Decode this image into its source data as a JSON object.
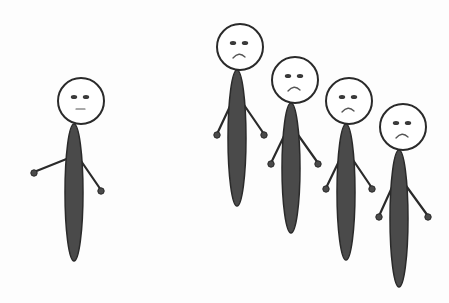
{
  "scene": {
    "description": "Illustration: one lone stick figure with neutral expression on the left, a group of four sad stick figures on the right",
    "background": "#fdfdfd",
    "stroke_color": "#2a2a2a",
    "body_fill": "#4a4a4a",
    "head_fill": "#ffffff"
  },
  "figures": [
    {
      "id": "lone",
      "expression": "neutral",
      "head": {
        "cx": 81,
        "cy": 101,
        "r": 23
      },
      "body": {
        "top": 124,
        "bottom": 261,
        "cx": 74,
        "rx": 9
      },
      "arms": {
        "left_hand": [
          34,
          172
        ],
        "right_hand": [
          101,
          190
        ],
        "shoulder_y": 158
      }
    },
    {
      "id": "group-1",
      "expression": "sad",
      "head": {
        "cx": 240,
        "cy": 47,
        "r": 23
      },
      "body": {
        "top": 70,
        "bottom": 206,
        "cx": 237,
        "rx": 9
      },
      "arms": {
        "left_hand": [
          217,
          134
        ],
        "right_hand": [
          264,
          134
        ],
        "shoulder_y": 102
      }
    },
    {
      "id": "group-2",
      "expression": "sad",
      "head": {
        "cx": 295,
        "cy": 80,
        "r": 23
      },
      "body": {
        "top": 103,
        "bottom": 233,
        "cx": 291,
        "rx": 9
      },
      "arms": {
        "left_hand": [
          271,
          163
        ],
        "right_hand": [
          318,
          163
        ],
        "shoulder_y": 132
      }
    },
    {
      "id": "group-3",
      "expression": "sad",
      "head": {
        "cx": 349,
        "cy": 101,
        "r": 23
      },
      "body": {
        "top": 124,
        "bottom": 260,
        "cx": 346,
        "rx": 9
      },
      "arms": {
        "left_hand": [
          326,
          188
        ],
        "right_hand": [
          372,
          188
        ],
        "shoulder_y": 157
      }
    },
    {
      "id": "group-4",
      "expression": "sad",
      "head": {
        "cx": 403,
        "cy": 127,
        "r": 23
      },
      "body": {
        "top": 150,
        "bottom": 287,
        "cx": 399,
        "rx": 9
      },
      "arms": {
        "left_hand": [
          379,
          216
        ],
        "right_hand": [
          428,
          216
        ],
        "shoulder_y": 183
      }
    }
  ]
}
